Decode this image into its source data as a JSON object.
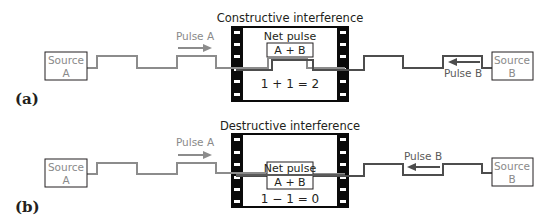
{
  "panels": [
    {
      "id": "a",
      "label": "(a)",
      "title": "Constructive interference",
      "source_a": {
        "line1": "Source",
        "line2": "A"
      },
      "source_b": {
        "line1": "Source",
        "line2": "B"
      },
      "pulse_a_label": "Pulse A",
      "pulse_b_label": "Pulse B",
      "net_pulse_label": "Net pulse",
      "net_pulse_value": "A + B",
      "equation": "1 + 1 = 2",
      "type": "constructive"
    },
    {
      "id": "b",
      "label": "(b)",
      "title": "Destructive interference",
      "source_a": {
        "line1": "Source",
        "line2": "A"
      },
      "source_b": {
        "line1": "Source",
        "line2": "B"
      },
      "pulse_a_label": "Pulse A",
      "pulse_b_label": "Pulse B",
      "net_pulse_label": "Net pulse",
      "net_pulse_value": "A + B",
      "equation": "1 − 1 = 0",
      "type": "destructive"
    }
  ],
  "colors": {
    "wave_a": "#8c8c8c",
    "wave_b": "#4d4d4d",
    "film": "#0a0a0a",
    "box_border": "#231f20",
    "source_text": "#8a8a8a"
  }
}
